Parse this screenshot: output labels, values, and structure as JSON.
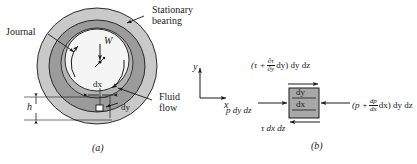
{
  "figure": {
    "panel_a": {
      "caption": "(a)",
      "labels": {
        "stationary_bearing_line1": "Stationary",
        "stationary_bearing_line2": "bearing",
        "journal": "Journal",
        "fluid_flow_line1": "Fluid",
        "fluid_flow_line2": "flow",
        "load": "W",
        "dx": "dx",
        "dy": "dy",
        "film_thickness": "h"
      },
      "colors": {
        "bearing_outer_ring": "#c9c9c9",
        "bearing_inner_ring": "#9d9d9d",
        "journal_fill": "#f2f2f2",
        "outline": "#1a1a1a"
      }
    },
    "panel_b": {
      "caption": "(b)",
      "axes": {
        "x": "x",
        "y": "y"
      },
      "element": {
        "top_edge_label": "dy",
        "bottom_edge_label": "dx",
        "fill": "#a8a8a8"
      },
      "forces": {
        "top_shear_prefix": "(τ +",
        "top_shear_numerator": "∂τ",
        "top_shear_denominator": "∂y",
        "top_shear_mid": "dy)",
        "top_shear_suffix": "dy dz",
        "left_pressure": "p dy dz",
        "right_pressure_prefix": "(p +",
        "right_pressure_numerator": "dp",
        "right_pressure_denominator": "dx",
        "right_pressure_mid": "dx)",
        "right_pressure_suffix": "dy dz",
        "bottom_shear": "τ dx dz"
      }
    }
  }
}
